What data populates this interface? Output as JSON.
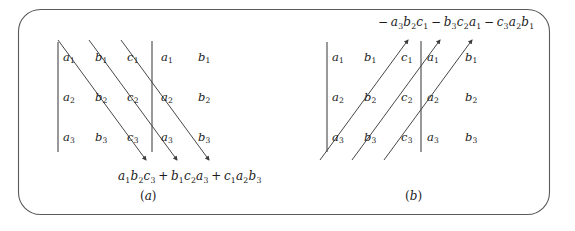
{
  "figure": {
    "frame": {
      "stroke_color": "#555555",
      "corner_radius": 22,
      "x": 18,
      "y": 9,
      "width": 532,
      "height": 206
    },
    "ink_color": "#3d3d3d"
  },
  "panels": [
    {
      "id": "a",
      "caption": "(a)",
      "caption_letter": "a",
      "direction": "down-right",
      "arrow_direction": "down-right",
      "columns": [
        "a",
        "b",
        "c",
        "a",
        "b"
      ],
      "rows": [
        "1",
        "2",
        "3"
      ],
      "cells": [
        [
          "a1",
          "b1",
          "c1",
          "a1",
          "b1"
        ],
        [
          "a2",
          "b2",
          "c2",
          "a2",
          "b2"
        ],
        [
          "a3",
          "b3",
          "c3",
          "a3",
          "b3"
        ]
      ],
      "cell_letters": [
        [
          {
            "base": "a",
            "sub": "1"
          },
          {
            "base": "b",
            "sub": "1"
          },
          {
            "base": "c",
            "sub": "1"
          },
          {
            "base": "a",
            "sub": "1"
          },
          {
            "base": "b",
            "sub": "1"
          }
        ],
        [
          {
            "base": "a",
            "sub": "2"
          },
          {
            "base": "b",
            "sub": "2"
          },
          {
            "base": "c",
            "sub": "2"
          },
          {
            "base": "a",
            "sub": "2"
          },
          {
            "base": "b",
            "sub": "2"
          }
        ],
        [
          {
            "base": "a",
            "sub": "3"
          },
          {
            "base": "b",
            "sub": "3"
          },
          {
            "base": "c",
            "sub": "3"
          },
          {
            "base": "a",
            "sub": "3"
          },
          {
            "base": "b",
            "sub": "3"
          }
        ]
      ],
      "formula_position": "below",
      "formula_terms": [
        {
          "sign": "",
          "factors": [
            {
              "base": "a",
              "sub": "1"
            },
            {
              "base": "b",
              "sub": "2"
            },
            {
              "base": "c",
              "sub": "3"
            }
          ]
        },
        {
          "sign": "+",
          "factors": [
            {
              "base": "b",
              "sub": "1"
            },
            {
              "base": "c",
              "sub": "2"
            },
            {
              "base": "a",
              "sub": "3"
            }
          ]
        },
        {
          "sign": "+",
          "factors": [
            {
              "base": "c",
              "sub": "1"
            },
            {
              "base": "a",
              "sub": "2"
            },
            {
              "base": "b",
              "sub": "3"
            }
          ]
        }
      ],
      "formula_plain": "a1b2c3 + b1c2a3 + c1a2b3",
      "diagonal_count": 3,
      "vertical_bars": 2
    },
    {
      "id": "b",
      "caption": "(b)",
      "caption_letter": "b",
      "direction": "up-right",
      "arrow_direction": "up-right",
      "columns": [
        "a",
        "b",
        "c",
        "a",
        "b"
      ],
      "rows": [
        "1",
        "2",
        "3"
      ],
      "cells": [
        [
          "a1",
          "b1",
          "c1",
          "a1",
          "b1"
        ],
        [
          "a2",
          "b2",
          "c2",
          "a2",
          "b2"
        ],
        [
          "a3",
          "b3",
          "c3",
          "a3",
          "b3"
        ]
      ],
      "cell_letters": [
        [
          {
            "base": "a",
            "sub": "1"
          },
          {
            "base": "b",
            "sub": "1"
          },
          {
            "base": "c",
            "sub": "1"
          },
          {
            "base": "a",
            "sub": "1"
          },
          {
            "base": "b",
            "sub": "1"
          }
        ],
        [
          {
            "base": "a",
            "sub": "2"
          },
          {
            "base": "b",
            "sub": "2"
          },
          {
            "base": "c",
            "sub": "2"
          },
          {
            "base": "a",
            "sub": "2"
          },
          {
            "base": "b",
            "sub": "2"
          }
        ],
        [
          {
            "base": "a",
            "sub": "3"
          },
          {
            "base": "b",
            "sub": "3"
          },
          {
            "base": "c",
            "sub": "3"
          },
          {
            "base": "a",
            "sub": "3"
          },
          {
            "base": "b",
            "sub": "3"
          }
        ]
      ],
      "formula_position": "above",
      "formula_terms": [
        {
          "sign": "−",
          "factors": [
            {
              "base": "a",
              "sub": "3"
            },
            {
              "base": "b",
              "sub": "2"
            },
            {
              "base": "c",
              "sub": "1"
            }
          ]
        },
        {
          "sign": "−",
          "factors": [
            {
              "base": "b",
              "sub": "3"
            },
            {
              "base": "c",
              "sub": "2"
            },
            {
              "base": "a",
              "sub": "1"
            }
          ]
        },
        {
          "sign": "−",
          "factors": [
            {
              "base": "c",
              "sub": "3"
            },
            {
              "base": "a",
              "sub": "2"
            },
            {
              "base": "b",
              "sub": "1"
            }
          ]
        }
      ],
      "formula_plain": "-a3b2c1 - b3c2a1 - c3a2b1",
      "diagonal_count": 3,
      "vertical_bars": 2
    }
  ],
  "text": {
    "a_r1c1": "a",
    "a_r1c1_sub": "1",
    "a_r1c2": "b",
    "a_r1c2_sub": "1",
    "a_r1c3": "c",
    "a_r1c3_sub": "1",
    "a_r1c4": "a",
    "a_r1c4_sub": "1",
    "a_r1c5": "b",
    "a_r1c5_sub": "1",
    "a_r2c1": "a",
    "a_r2c1_sub": "2",
    "a_r2c2": "b",
    "a_r2c2_sub": "2",
    "a_r2c3": "c",
    "a_r2c3_sub": "2",
    "a_r2c4": "a",
    "a_r2c4_sub": "2",
    "a_r2c5": "b",
    "a_r2c5_sub": "2",
    "a_r3c1": "a",
    "a_r3c1_sub": "3",
    "a_r3c2": "b",
    "a_r3c2_sub": "3",
    "a_r3c3": "c",
    "a_r3c3_sub": "3",
    "a_r3c4": "a",
    "a_r3c4_sub": "3",
    "a_r3c5": "b",
    "a_r3c5_sub": "3",
    "b_r1c1": "a",
    "b_r1c1_sub": "1",
    "b_r1c2": "b",
    "b_r1c2_sub": "1",
    "b_r1c3": "c",
    "b_r1c3_sub": "1",
    "b_r1c4": "a",
    "b_r1c4_sub": "1",
    "b_r1c5": "b",
    "b_r1c5_sub": "1",
    "b_r2c1": "a",
    "b_r2c1_sub": "2",
    "b_r2c2": "b",
    "b_r2c2_sub": "2",
    "b_r2c3": "c",
    "b_r2c3_sub": "2",
    "b_r2c4": "a",
    "b_r2c4_sub": "2",
    "b_r2c5": "b",
    "b_r2c5_sub": "2",
    "b_r3c1": "a",
    "b_r3c1_sub": "3",
    "b_r3c2": "b",
    "b_r3c2_sub": "3",
    "b_r3c3": "c",
    "b_r3c3_sub": "3",
    "b_r3c4": "a",
    "b_r3c4_sub": "3",
    "b_r3c5": "b",
    "b_r3c5_sub": "3",
    "caption_a": "a",
    "caption_b": "b",
    "op_plus": "+",
    "op_minus": "−",
    "lead_minus": "−"
  }
}
